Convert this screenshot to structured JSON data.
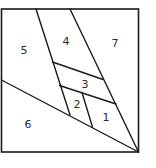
{
  "diagram": {
    "colors": {
      "stroke": "#1a1a1a",
      "background": "#ffffff",
      "label": "#2a2a2a"
    },
    "frame": {
      "x": 1.5,
      "y": 9,
      "width": 137,
      "height": 143
    },
    "segments": [
      {
        "name": "left-strip-line",
        "x1": 36,
        "y1": 9,
        "x2": 70,
        "y2": 115
      },
      {
        "name": "right-strip-line",
        "x1": 70,
        "y1": 9,
        "x2": 138.5,
        "y2": 152
      },
      {
        "name": "long-diagonal-line",
        "x1": 1.5,
        "y1": 80,
        "x2": 138.5,
        "y2": 152
      },
      {
        "name": "upper-divider-line",
        "x1": 52.5,
        "y1": 62,
        "x2": 103,
        "y2": 79.5
      },
      {
        "name": "lower-divider-line",
        "x1": 59.5,
        "y1": 85.5,
        "x2": 116,
        "y2": 104
      },
      {
        "name": "region-1-2-divider-line",
        "x1": 82,
        "y1": 92.5,
        "x2": 92.5,
        "y2": 127
      }
    ],
    "regions": [
      {
        "label": "1",
        "x": 106,
        "y": 118
      },
      {
        "label": "2",
        "x": 77,
        "y": 105
      },
      {
        "label": "3",
        "x": 85,
        "y": 85
      },
      {
        "label": "4",
        "x": 66,
        "y": 42
      },
      {
        "label": "5",
        "x": 24,
        "y": 51
      },
      {
        "label": "6",
        "x": 28,
        "y": 125
      },
      {
        "label": "7",
        "x": 115,
        "y": 44
      }
    ]
  }
}
